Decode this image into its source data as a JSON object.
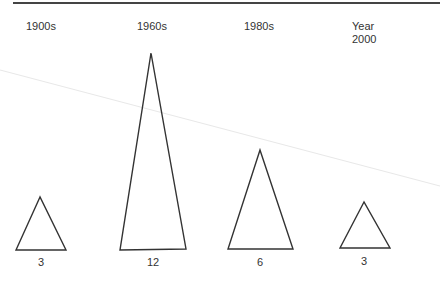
{
  "diagram": {
    "columns": [
      {
        "label": "1900s",
        "value": "3"
      },
      {
        "label": "1960s",
        "value": "12"
      },
      {
        "label": "1980s",
        "value": "6"
      },
      {
        "label_line1": "Year",
        "label_line2": "2000",
        "value": "3"
      }
    ]
  },
  "colors": {
    "stroke": "#333333",
    "faint_line": "#e6e6e6",
    "top_rule": "#444444"
  }
}
